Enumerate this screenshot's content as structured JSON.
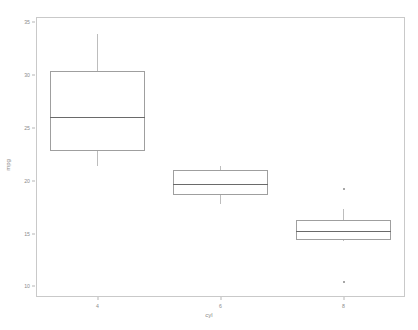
{
  "chart_data": {
    "type": "box",
    "title": "",
    "xlabel": "cyl",
    "ylabel": "mpg",
    "ylim": [
      9.0,
      35.5
    ],
    "yticks": [
      35,
      30,
      25,
      20,
      15,
      10
    ],
    "ytick_labels": [
      "35",
      "30",
      "25",
      "20",
      "15",
      "10"
    ],
    "categories": [
      "4",
      "6",
      "8"
    ],
    "grid": false,
    "legend": "none",
    "boxes": [
      {
        "category": "4",
        "lower_whisker": 21.4,
        "q1": 22.8,
        "median": 26.0,
        "q3": 30.4,
        "upper_whisker": 33.9,
        "outliers": []
      },
      {
        "category": "6",
        "lower_whisker": 17.8,
        "q1": 18.65,
        "median": 19.7,
        "q3": 21.0,
        "upper_whisker": 21.4,
        "outliers": []
      },
      {
        "category": "8",
        "lower_whisker": 14.3,
        "q1": 14.4,
        "median": 15.2,
        "q3": 16.25,
        "upper_whisker": 17.3,
        "outliers": [
          19.2,
          10.4
        ]
      }
    ]
  },
  "axis": {
    "x_label": "cyl",
    "y_label": "mpg"
  },
  "colors": {
    "panel_border": "#c9c9c9",
    "box_border": "#9f9f9f",
    "median_line": "#6a6a6a",
    "whisker": "#bdbdbd",
    "outlier": "#8a8a8a",
    "tick_text": "#8c8c8c",
    "background": "#ffffff"
  }
}
